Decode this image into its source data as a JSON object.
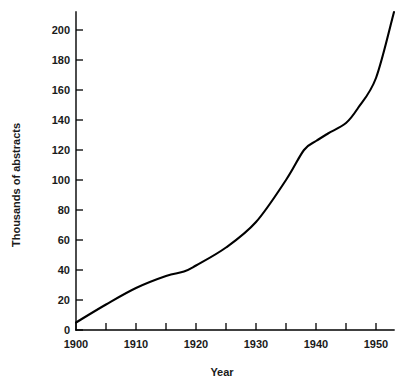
{
  "chart_data": {
    "type": "line",
    "title": "",
    "subtitle": "",
    "xlabel": "Year",
    "ylabel": "Thousands of abstracts",
    "xlim": [
      1900,
      1953
    ],
    "ylim": [
      0,
      212
    ],
    "grid": false,
    "legend": false,
    "legend_position": "none",
    "x_major_ticks": [
      1900,
      1910,
      1920,
      1930,
      1940,
      1950
    ],
    "x_major_tick_labels": [
      "1900",
      "1910",
      "1920",
      "1930",
      "1940",
      "1950"
    ],
    "x_minor_ticks": [
      1905,
      1915,
      1925,
      1935,
      1945
    ],
    "y_major_ticks": [
      0,
      20,
      40,
      60,
      80,
      100,
      120,
      140,
      160,
      180,
      200
    ],
    "y_major_tick_labels": [
      "0",
      "20",
      "40",
      "60",
      "80",
      "100",
      "120",
      "140",
      "160",
      "180",
      "200"
    ],
    "series": [
      {
        "name": "Abstracts published",
        "x": [
          1900,
          1905,
          1910,
          1915,
          1918,
          1920,
          1925,
          1930,
          1935,
          1938,
          1940,
          1942,
          1945,
          1947,
          1950,
          1953
        ],
        "values": [
          5,
          17,
          28,
          36,
          39,
          43,
          55,
          72,
          100,
          120,
          126,
          131,
          138,
          148,
          168,
          212
        ]
      }
    ],
    "annotations": [],
    "line_color": "#000000",
    "background_color": "#ffffff",
    "axis_color": "#000000"
  }
}
